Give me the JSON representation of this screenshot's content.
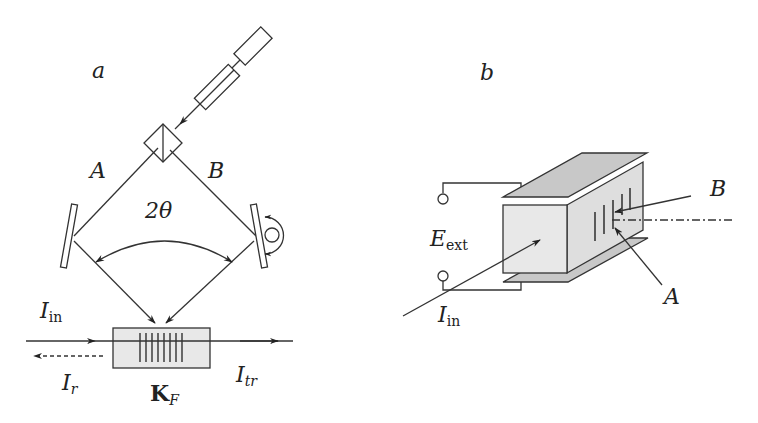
{
  "colors": {
    "stroke": "#333333",
    "crystal_fill": "#e8e8e8",
    "plate_fill": "#c8c8c8",
    "side_fill": "#dedede",
    "background": "#ffffff"
  },
  "panel_a": {
    "label": "a",
    "beam_a_label": "A",
    "beam_b_label": "B",
    "angle_label": "2θ",
    "input_label": {
      "main": "I",
      "sub": "in"
    },
    "reflected_label": {
      "main": "I",
      "sub": "r"
    },
    "transmitted_label": {
      "main": "I",
      "sub": "tr"
    },
    "crystal_label": {
      "main": "K",
      "sub": "F"
    },
    "components": [
      "laser",
      "expander",
      "beam-splitter-cube",
      "mirror-left",
      "mirror-right-rotatable",
      "crystal-with-grating"
    ]
  },
  "panel_b": {
    "label": "b",
    "field_label": {
      "main": "E",
      "sub": "ext"
    },
    "input_label": {
      "main": "I",
      "sub": "in"
    },
    "beam_a_label": "A",
    "beam_b_label": "B",
    "components": [
      "crystal-block",
      "top-electrode",
      "bottom-electrode",
      "terminals",
      "grating-fringes"
    ]
  }
}
